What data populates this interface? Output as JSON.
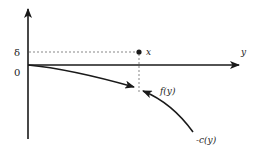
{
  "diagram": {
    "axes": {
      "vertical_axis": {
        "label": ""
      },
      "horizontal_axis": {
        "label": "y"
      }
    },
    "tick_labels": {
      "delta": "δ",
      "zero": "0"
    },
    "point": {
      "label": "x"
    },
    "curves": {
      "f": {
        "label": "f(y)"
      },
      "c": {
        "label": "-c(y)"
      }
    },
    "colors": {
      "line": "#1a1a1a",
      "dashed": "#555555"
    }
  }
}
